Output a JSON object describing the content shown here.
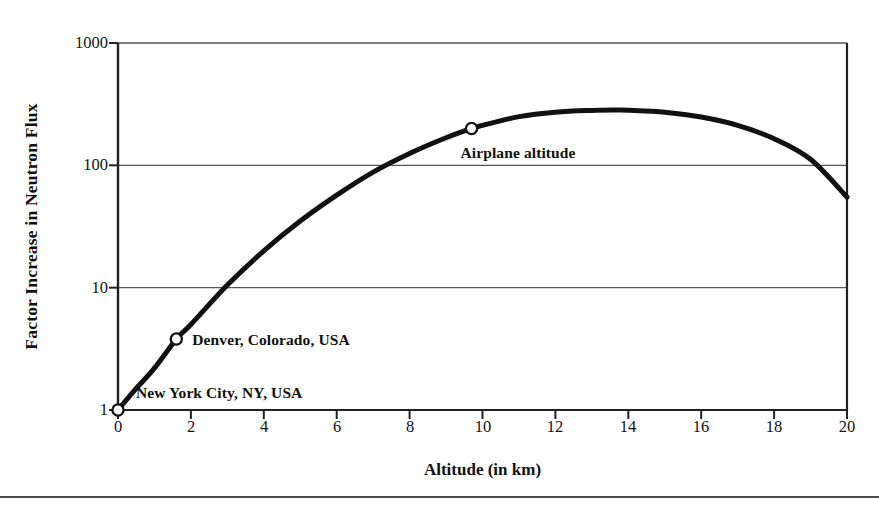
{
  "chart_data": {
    "type": "line",
    "title": "",
    "subtitle": "",
    "xlabel": "Altitude (in km)",
    "ylabel": "Factor Increase in Neutron Flux",
    "yscale": "log",
    "xscale": "linear",
    "xlim": [
      0,
      20
    ],
    "ylim": [
      1,
      1000
    ],
    "grid": "horizontal",
    "legend": "none",
    "xticks": [
      0,
      2,
      4,
      6,
      8,
      10,
      12,
      14,
      16,
      18,
      20
    ],
    "xtick_labels": [
      "0",
      "2",
      "4",
      "6",
      "8",
      "10",
      "12",
      "14",
      "16",
      "18",
      "20"
    ],
    "yticks": [
      1,
      10,
      100,
      1000
    ],
    "ytick_labels": [
      "1",
      "10",
      "100",
      "1000"
    ],
    "series": [
      {
        "name": "Factor increase in neutron flux",
        "x": [
          0,
          0.5,
          1,
          1.6,
          2,
          3,
          4,
          5,
          6,
          7,
          8,
          9,
          9.7,
          10,
          11,
          12,
          13,
          13.7,
          14,
          15,
          16,
          17,
          18,
          19,
          20
        ],
        "y": [
          1,
          1.5,
          2.2,
          3.8,
          5.0,
          10.5,
          20,
          35,
          57,
          88,
          125,
          168,
          200,
          212,
          250,
          272,
          281,
          283,
          282,
          272,
          248,
          212,
          165,
          112,
          55
        ]
      }
    ],
    "markers": [
      {
        "label": "New York City, NY, USA",
        "x": 0,
        "y": 1,
        "style": "open-circle",
        "label_position": "right"
      },
      {
        "label": "Denver, Colorado, USA",
        "x": 1.6,
        "y": 3.8,
        "style": "open-circle",
        "label_position": "right"
      },
      {
        "label": "Airplane altitude",
        "x": 9.7,
        "y": 200,
        "style": "open-circle",
        "label_position": "below-right"
      }
    ],
    "colors": {
      "curve": "#111111",
      "axis": "#222222",
      "grid": "#555555",
      "marker_fill": "#ffffff",
      "marker_stroke": "#111111",
      "background": "#ffffff"
    }
  }
}
